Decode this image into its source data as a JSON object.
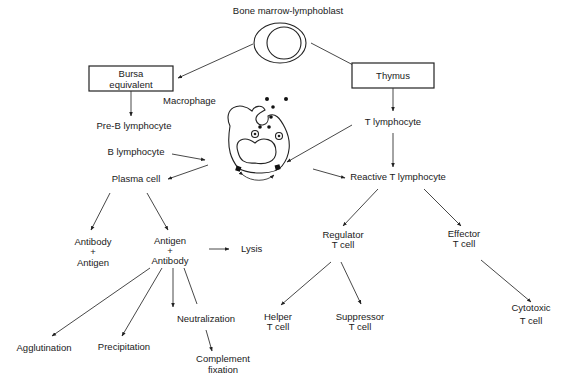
{
  "title": "Bone marrow-lymphoblast",
  "nodes": {
    "bone_marrow": "Bone marrow-lymphoblast",
    "bursa_line1": "Bursa",
    "bursa_line2": "equivalent",
    "thymus": "Thymus",
    "macrophage": "Macrophage",
    "pre_b": "Pre-B lymphocyte",
    "b_lymph": "B lymphocyte",
    "plasma": "Plasma cell",
    "t_lymph": "T lymphocyte",
    "reactive_t": "Reactive T lymphocyte",
    "ab_ag_1": "Antibody",
    "ab_ag_plus": "+",
    "ab_ag_2": "Antigen",
    "ag_ab_1": "Antigen",
    "ag_ab_plus": "+",
    "ag_ab_2": "Antibody",
    "lysis": "Lysis",
    "regulator_1": "Regulator",
    "regulator_2": "T cell",
    "effector_1": "Effector",
    "effector_2": "T cell",
    "helper_1": "Helper",
    "helper_2": "T cell",
    "suppressor_1": "Suppressor",
    "suppressor_2": "T cell",
    "cytotoxic_1": "Cytotoxic",
    "cytotoxic_2": "T cell",
    "agglutination": "Agglutination",
    "precipitation": "Precipitation",
    "neutralization": "Neutralization",
    "complement_1": "Complement",
    "complement_2": "fixation"
  }
}
